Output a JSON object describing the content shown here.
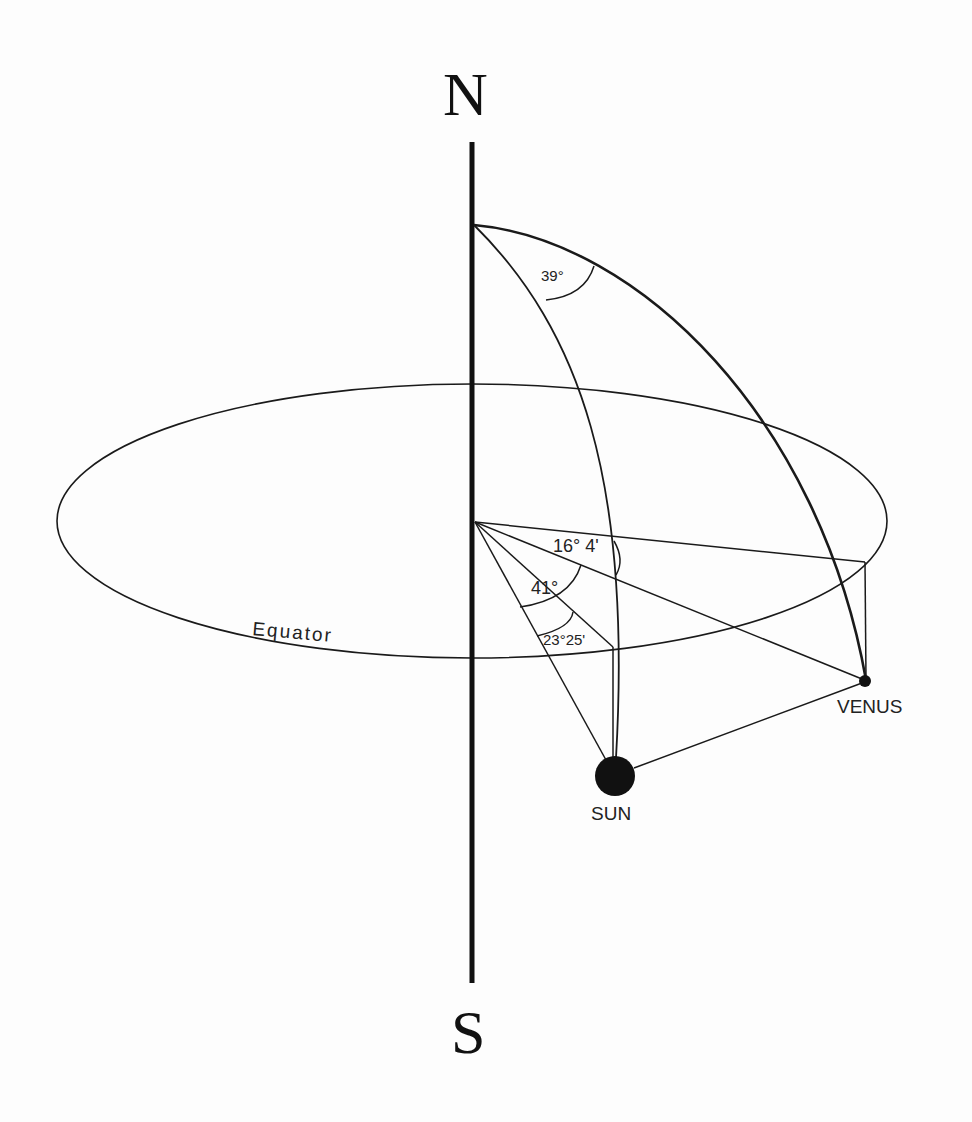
{
  "diagram": {
    "type": "celestial-sphere",
    "colors": {
      "ink": "#1a1a1a",
      "background": "#fdfdfd"
    },
    "poles": {
      "north": "N",
      "south": "S"
    },
    "equator_label": "Equator",
    "bodies": {
      "sun": {
        "label": "SUN"
      },
      "venus": {
        "label": "VENUS"
      }
    },
    "angles": {
      "meridian_separation": "39°",
      "venus_declination": "16° 4'",
      "sun_venus_arc": "41°",
      "sun_declination": "23°25'"
    }
  }
}
